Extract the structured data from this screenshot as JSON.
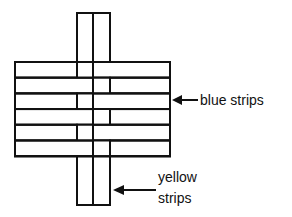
{
  "diagram": {
    "type": "weaving",
    "vertical_strip_count": 2,
    "horizontal_strip_count": 6,
    "weave_pattern": [
      {
        "row": 1,
        "over": "left"
      },
      {
        "row": 2,
        "over": "right"
      },
      {
        "row": 3,
        "over": "left"
      },
      {
        "row": 4,
        "over": "right"
      },
      {
        "row": 5,
        "over": "left"
      },
      {
        "row": 6,
        "over": "right"
      }
    ],
    "line_color": "#111111",
    "background_color": "#ffffff"
  },
  "labels": {
    "blue": "blue strips",
    "yellow_line1": "yellow",
    "yellow_line2": "strips"
  }
}
